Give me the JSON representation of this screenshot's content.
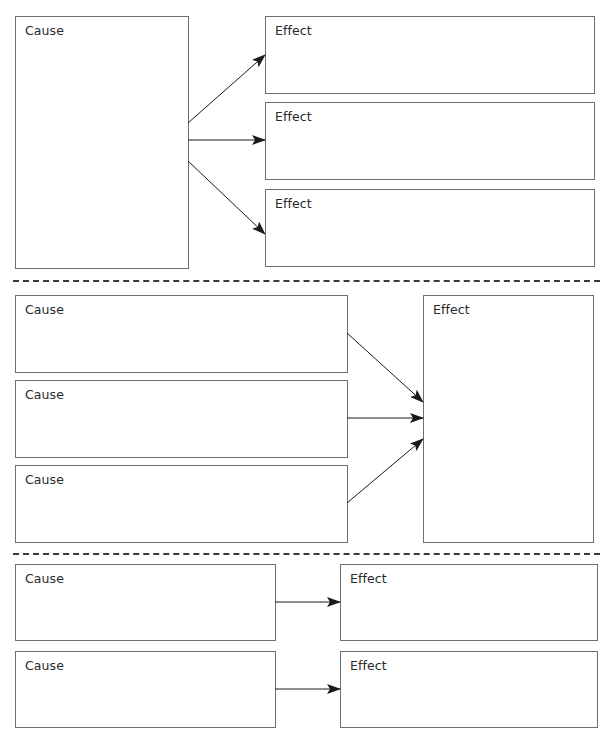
{
  "diagram": {
    "sections": [
      {
        "id": "one-cause-many-effects",
        "causes": [
          {
            "label": "Cause",
            "x": 15,
            "y": 16,
            "w": 174,
            "h": 253
          }
        ],
        "effects": [
          {
            "label": "Effect",
            "x": 265,
            "y": 16,
            "w": 330,
            "h": 78
          },
          {
            "label": "Effect",
            "x": 265,
            "y": 102,
            "w": 330,
            "h": 78
          },
          {
            "label": "Effect",
            "x": 265,
            "y": 189,
            "w": 330,
            "h": 78
          }
        ],
        "arrows": [
          {
            "x1": 188,
            "y1": 123,
            "x2": 265,
            "y2": 55
          },
          {
            "x1": 188,
            "y1": 140,
            "x2": 265,
            "y2": 140
          },
          {
            "x1": 188,
            "y1": 161,
            "x2": 265,
            "y2": 234
          }
        ]
      },
      {
        "id": "many-causes-one-effect",
        "causes": [
          {
            "label": "Cause",
            "x": 15,
            "y": 295,
            "w": 333,
            "h": 78
          },
          {
            "label": "Cause",
            "x": 15,
            "y": 380,
            "w": 333,
            "h": 78
          },
          {
            "label": "Cause",
            "x": 15,
            "y": 465,
            "w": 333,
            "h": 78
          }
        ],
        "effects": [
          {
            "label": "Effect",
            "x": 423,
            "y": 295,
            "w": 171,
            "h": 248
          }
        ],
        "arrows": [
          {
            "x1": 347,
            "y1": 333,
            "x2": 423,
            "y2": 402
          },
          {
            "x1": 347,
            "y1": 418,
            "x2": 423,
            "y2": 418
          },
          {
            "x1": 347,
            "y1": 503,
            "x2": 423,
            "y2": 439
          }
        ]
      },
      {
        "id": "one-to-one",
        "causes": [
          {
            "label": "Cause",
            "x": 15,
            "y": 564,
            "w": 261,
            "h": 77
          },
          {
            "label": "Cause",
            "x": 15,
            "y": 651,
            "w": 261,
            "h": 77
          }
        ],
        "effects": [
          {
            "label": "Effect",
            "x": 340,
            "y": 564,
            "w": 258,
            "h": 77
          },
          {
            "label": "Effect",
            "x": 340,
            "y": 651,
            "w": 258,
            "h": 77
          }
        ],
        "arrows": [
          {
            "x1": 275,
            "y1": 602,
            "x2": 340,
            "y2": 602
          },
          {
            "x1": 275,
            "y1": 689,
            "x2": 340,
            "y2": 689
          }
        ]
      }
    ],
    "separators": [
      {
        "y": 281
      },
      {
        "y": 554
      }
    ],
    "colors": {
      "border": "#6f6f6f",
      "arrow": "#1a1a1a",
      "dash": "#3a3a3a",
      "text": "#2a2a2a"
    }
  }
}
